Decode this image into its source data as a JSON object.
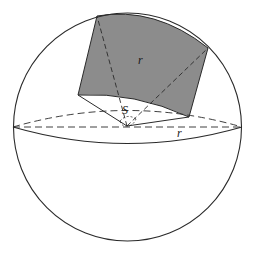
{
  "figure": {
    "colors": {
      "stroke": "#2a2a2a",
      "shaded_region": "#8c8c8c",
      "background": "#ffffff"
    },
    "labels": {
      "region_radius": "r",
      "solid_angle": "S",
      "equator_radius": "r"
    }
  }
}
